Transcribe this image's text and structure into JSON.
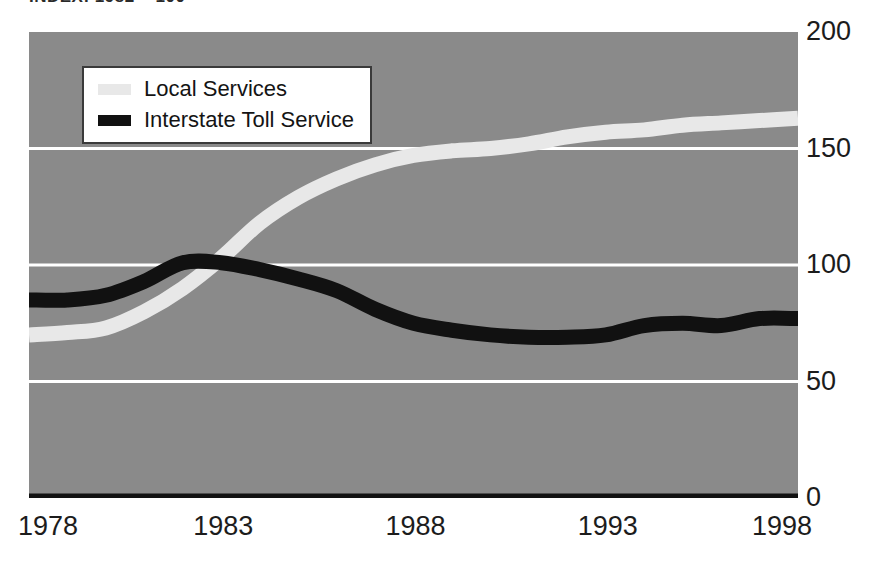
{
  "chart_data": {
    "type": "line",
    "title": "INDEX: 1982 = 100",
    "xlabel": "",
    "ylabel": "",
    "xlim": [
      1978,
      1998
    ],
    "ylim": [
      0,
      200
    ],
    "x_ticks": [
      "1978",
      "1983",
      "1988",
      "1993",
      "1998"
    ],
    "y_ticks": [
      "0",
      "50",
      "100",
      "150",
      "200"
    ],
    "grid": "horizontal",
    "legend_position": "upper-left-inside",
    "plot_background": "#8a8a8a",
    "gridline_color": "#ffffff",
    "x": [
      1978,
      1979,
      1980,
      1981,
      1982,
      1983,
      1984,
      1985,
      1986,
      1987,
      1988,
      1989,
      1990,
      1991,
      1992,
      1993,
      1994,
      1995,
      1996,
      1997,
      1998
    ],
    "series": [
      {
        "name": "Local Services",
        "color": "#e8e8e8",
        "values": [
          70,
          71,
          73,
          80,
          90,
          103,
          118,
          129,
          137,
          143,
          147,
          149,
          150,
          152,
          155,
          157,
          158,
          160,
          161,
          162,
          163
        ]
      },
      {
        "name": "Interstate Toll Service",
        "color": "#111111",
        "values": [
          85,
          85,
          87,
          93,
          101,
          101,
          98,
          94,
          89,
          81,
          75,
          72,
          70,
          69,
          69,
          70,
          74,
          75,
          74,
          77,
          77
        ]
      }
    ]
  },
  "legend": {
    "items": [
      {
        "label": "Local Services",
        "swatch_color": "#e8e8e8"
      },
      {
        "label": "Interstate Toll Service",
        "swatch_color": "#111111"
      }
    ]
  },
  "axes": {
    "y_labels": [
      {
        "text": "200",
        "value": 200
      },
      {
        "text": "150",
        "value": 150
      },
      {
        "text": "100",
        "value": 100
      },
      {
        "text": "50",
        "value": 50
      },
      {
        "text": "0",
        "value": 0
      }
    ],
    "x_labels": [
      {
        "text": "1978",
        "value": 1978
      },
      {
        "text": "1983",
        "value": 1983
      },
      {
        "text": "1988",
        "value": 1988
      },
      {
        "text": "1993",
        "value": 1993
      },
      {
        "text": "1998",
        "value": 1998
      }
    ]
  }
}
